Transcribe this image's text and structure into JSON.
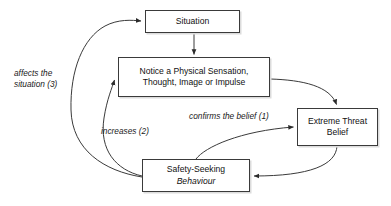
{
  "diagram": {
    "background_color": "#ffffff",
    "line_color": "#3a3a3a",
    "text_color": "#111111",
    "nodes": {
      "situation": {
        "label": "Situation",
        "lines": [
          "Situation"
        ]
      },
      "notice": {
        "line1": "Notice a Physical Sensation,",
        "line2": "Thought, Image or Impulse"
      },
      "threat": {
        "line1": "Extreme Threat",
        "line2": "Belief"
      },
      "safety": {
        "line1": "Safety-Seeking",
        "line2": "Behaviour"
      }
    },
    "edge_labels": {
      "affects": {
        "line1": "affects the",
        "line2": "situation (3)",
        "full": "affects the situation (3)"
      },
      "increases": {
        "line1": "increases (2)",
        "full": "increases (2)"
      },
      "confirms": {
        "line1": "confirms the belief (1)",
        "full": "confirms the belief (1)"
      }
    },
    "edges": [
      {
        "from": "situation",
        "to": "notice",
        "label": "",
        "style": "straight"
      },
      {
        "from": "notice",
        "to": "threat",
        "label": "",
        "style": "curved"
      },
      {
        "from": "safety",
        "to": "threat",
        "label": "confirms the belief (1)",
        "style": "curved"
      },
      {
        "from": "threat",
        "to": "safety",
        "label": "",
        "style": "curved"
      },
      {
        "from": "safety",
        "to": "notice",
        "label": "increases (2)",
        "style": "curved"
      },
      {
        "from": "safety",
        "to": "situation",
        "label": "affects the situation (3)",
        "style": "curved"
      }
    ]
  }
}
